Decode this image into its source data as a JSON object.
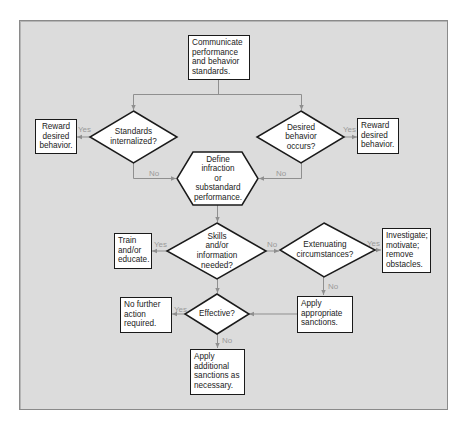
{
  "colors": {
    "background": "#dcdcdc",
    "frame_border": "#8a8a8a",
    "shape_fill": "#ffffff",
    "shape_border": "#1a1a1a",
    "connector": "#8f8f8f",
    "branch_label": "#9a9a9a"
  },
  "nodes": {
    "communicate": {
      "type": "process",
      "text": "Communicate\nperformance\nand behavior\nstandards."
    },
    "standards_internalized": {
      "type": "decision",
      "text": "Standards\ninternalized?"
    },
    "desired_behavior_occurs": {
      "type": "decision",
      "text": "Desired\nbehavior\noccurs?"
    },
    "reward_left": {
      "type": "process",
      "text": "Reward\ndesired\nbehavior."
    },
    "reward_right": {
      "type": "process",
      "text": "Reward\ndesired\nbehavior."
    },
    "define_infraction": {
      "type": "preparation",
      "text": "Define\ninfraction\nor\nsubstandard\nperformance."
    },
    "skills_needed": {
      "type": "decision",
      "text": "Skills\nand/or\ninformation\nneeded?"
    },
    "train_educate": {
      "type": "process",
      "text": "Train\nand/or\neducate."
    },
    "extenuating": {
      "type": "decision",
      "text": "Extenuating\ncircumstances?"
    },
    "investigate": {
      "type": "process",
      "text": "Investigate;\nmotivate;\nremove\nobstacles."
    },
    "apply_appropriate": {
      "type": "process",
      "text": "Apply\nappropriate\nsanctions."
    },
    "effective": {
      "type": "decision",
      "text": "Effective?"
    },
    "no_further_action": {
      "type": "process",
      "text": "No further\naction\nrequired."
    },
    "apply_additional": {
      "type": "process",
      "text": "Apply\nadditional\nsanctions as\nnecessary."
    }
  },
  "edges": [
    {
      "from": "communicate",
      "to": "standards_internalized",
      "label": ""
    },
    {
      "from": "communicate",
      "to": "desired_behavior_occurs",
      "label": ""
    },
    {
      "from": "standards_internalized",
      "to": "reward_left",
      "label": "Yes"
    },
    {
      "from": "desired_behavior_occurs",
      "to": "reward_right",
      "label": "Yes"
    },
    {
      "from": "standards_internalized",
      "to": "define_infraction",
      "label": "No"
    },
    {
      "from": "desired_behavior_occurs",
      "to": "define_infraction",
      "label": "No"
    },
    {
      "from": "define_infraction",
      "to": "skills_needed",
      "label": ""
    },
    {
      "from": "skills_needed",
      "to": "train_educate",
      "label": "Yes"
    },
    {
      "from": "skills_needed",
      "to": "extenuating",
      "label": "No"
    },
    {
      "from": "extenuating",
      "to": "investigate",
      "label": "Yes"
    },
    {
      "from": "extenuating",
      "to": "apply_appropriate",
      "label": "No"
    },
    {
      "from": "skills_needed",
      "to": "effective",
      "label": ""
    },
    {
      "from": "apply_appropriate",
      "to": "effective",
      "label": ""
    },
    {
      "from": "effective",
      "to": "no_further_action",
      "label": "Yes"
    },
    {
      "from": "effective",
      "to": "apply_additional",
      "label": "No"
    }
  ],
  "labels": {
    "yes_left_top": "Yes",
    "yes_right_top": "Yes",
    "no_left_mid": "No",
    "no_right_mid": "No",
    "yes_train": "Yes",
    "no_skills": "No",
    "yes_investigate": "Yes",
    "no_extenuating": "No",
    "yes_effective": "Yes",
    "no_effective": "No"
  }
}
